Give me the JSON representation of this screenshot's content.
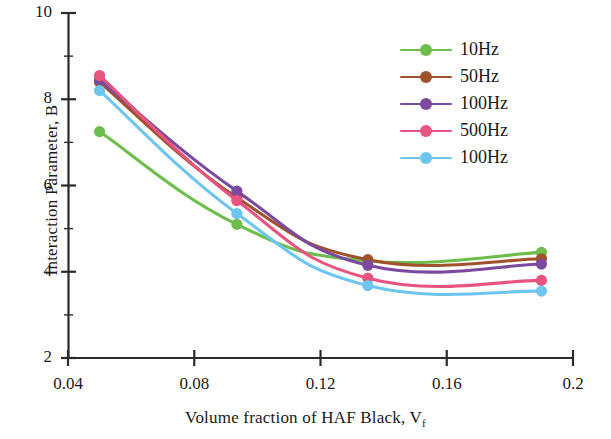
{
  "chart_data": {
    "type": "line",
    "title": "",
    "xlabel": "Volume fraction of HAF Black, Vf",
    "xlabel_main": "Volume fraction of HAF Black, V",
    "xlabel_sub": "f",
    "ylabel": "Interaction Parameter, B",
    "xlim": [
      0.04,
      0.2
    ],
    "ylim": [
      2,
      10
    ],
    "xticks": [
      "0.04",
      "0.08",
      "0.12",
      "0.16",
      "0.2"
    ],
    "xtick_values": [
      0.04,
      0.08,
      0.12,
      0.16,
      0.2
    ],
    "yticks": [
      "10",
      "8",
      "6",
      "4",
      "2"
    ],
    "ytick_values": [
      10,
      8,
      6,
      4,
      2
    ],
    "y_minor_ticks": [
      9,
      7,
      5,
      3
    ],
    "grid": false,
    "legend_position": "top-right",
    "x": [
      0.05,
      0.0935,
      0.135,
      0.19
    ],
    "series": [
      {
        "name": "10Hz",
        "color": "#6DBE4C",
        "values": [
          7.25,
          5.1,
          4.25,
          4.45
        ]
      },
      {
        "name": "50Hz",
        "color": "#A0522D",
        "values": [
          8.4,
          5.72,
          4.28,
          4.3
        ]
      },
      {
        "name": "100Hz",
        "color": "#7B4A9E",
        "values": [
          8.45,
          5.87,
          4.15,
          4.18
        ]
      },
      {
        "name": "500Hz",
        "color": "#E8547F",
        "values": [
          8.55,
          5.65,
          3.85,
          3.8
        ]
      },
      {
        "name": "100Hz",
        "color": "#6EC6F0",
        "values": [
          8.2,
          5.35,
          3.68,
          3.55
        ]
      }
    ]
  },
  "legend": {
    "items": [
      {
        "label": "10Hz",
        "color": "#6DBE4C"
      },
      {
        "label": "50Hz",
        "color": "#A0522D"
      },
      {
        "label": "100Hz",
        "color": "#7B4A9E"
      },
      {
        "label": "500Hz",
        "color": "#E8547F"
      },
      {
        "label": "100Hz",
        "color": "#6EC6F0"
      }
    ]
  },
  "axes": {
    "x_title_main": "Volume fraction of HAF Black, V",
    "x_title_sub": "f",
    "y_title": "Interaction Parameter, B",
    "x_tick_labels": [
      "0.04",
      "0.08",
      "0.12",
      "0.16",
      "0.2"
    ],
    "y_tick_labels": [
      "10",
      "8",
      "6",
      "4",
      "2"
    ]
  },
  "colors": {
    "axis": "#2b2b2b",
    "text": "#1a1a1a",
    "background": "#ffffff"
  }
}
